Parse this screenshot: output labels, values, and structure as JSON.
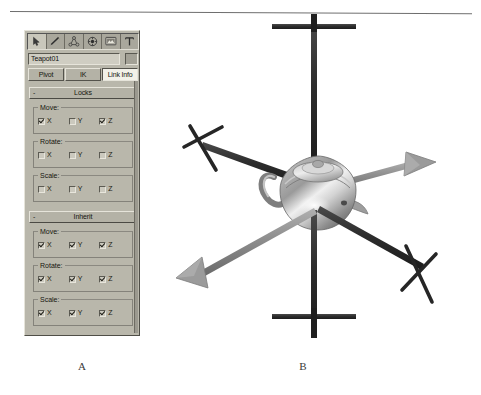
{
  "figure": {
    "caption_a": "A",
    "caption_b": "B"
  },
  "panel": {
    "tabs": [
      {
        "name": "create-tab",
        "icon": "arrow-cursor-icon",
        "selected": true
      },
      {
        "name": "modify-tab",
        "icon": "pencil-icon",
        "selected": false
      },
      {
        "name": "hierarchy-tab",
        "icon": "hierarchy-icon",
        "selected": false
      },
      {
        "name": "motion-tab",
        "icon": "wheel-icon",
        "selected": false
      },
      {
        "name": "display-tab",
        "icon": "monitor-icon",
        "selected": false
      },
      {
        "name": "utilities-tab",
        "icon": "hammer-t-icon",
        "selected": false
      }
    ],
    "name_field": {
      "value": "Teapot01",
      "placeholder": "Object name"
    },
    "color_swatch": "#a3a196",
    "mode_buttons": [
      {
        "label": "Pivot",
        "active": false
      },
      {
        "label": "IK",
        "active": false
      },
      {
        "label": "Link Info",
        "active": true
      }
    ],
    "rollouts": [
      {
        "id": "locks",
        "title": "Locks",
        "expand_glyph": "-",
        "groups": [
          {
            "label": "Move:",
            "axes": [
              {
                "label": "X",
                "checked": true
              },
              {
                "label": "Y",
                "checked": false
              },
              {
                "label": "Z",
                "checked": true
              }
            ]
          },
          {
            "label": "Rotate:",
            "axes": [
              {
                "label": "X",
                "checked": false
              },
              {
                "label": "Y",
                "checked": false
              },
              {
                "label": "Z",
                "checked": false
              }
            ]
          },
          {
            "label": "Scale:",
            "axes": [
              {
                "label": "X",
                "checked": false
              },
              {
                "label": "Y",
                "checked": false
              },
              {
                "label": "Z",
                "checked": false
              }
            ]
          }
        ]
      },
      {
        "id": "inherit",
        "title": "Inherit",
        "expand_glyph": "-",
        "groups": [
          {
            "label": "Move:",
            "axes": [
              {
                "label": "X",
                "checked": true
              },
              {
                "label": "Y",
                "checked": true
              },
              {
                "label": "Z",
                "checked": true
              }
            ]
          },
          {
            "label": "Rotate:",
            "axes": [
              {
                "label": "X",
                "checked": true
              },
              {
                "label": "Y",
                "checked": true
              },
              {
                "label": "Z",
                "checked": true
              }
            ]
          },
          {
            "label": "Scale:",
            "axes": [
              {
                "label": "X",
                "checked": true
              },
              {
                "label": "Y",
                "checked": true
              },
              {
                "label": "Z",
                "checked": true
              }
            ]
          }
        ]
      }
    ]
  },
  "viewport": {
    "object": "teapot",
    "axes": [
      {
        "id": "z-axis",
        "end_top": "bar-marker",
        "end_bottom": "bar-marker"
      },
      {
        "id": "y-axis-locked",
        "end_upper_left": "x-marker",
        "end_lower_right": "x-marker"
      },
      {
        "id": "x-axis-free",
        "end_upper_right": "arrowhead",
        "end_lower_left": "arrowhead"
      }
    ]
  },
  "colors": {
    "panel_face": "#b9b7ab",
    "panel_dark": "#4f4e47",
    "panel_light": "#e6e4da",
    "active_button": "#f2f1e9",
    "axis_dark": "#2b2b2b",
    "axis_gray": "#8e8e8e",
    "teapot_light": "#f0f0f0",
    "teapot_mid": "#a8a8a8",
    "teapot_dark": "#6b6b6b"
  }
}
